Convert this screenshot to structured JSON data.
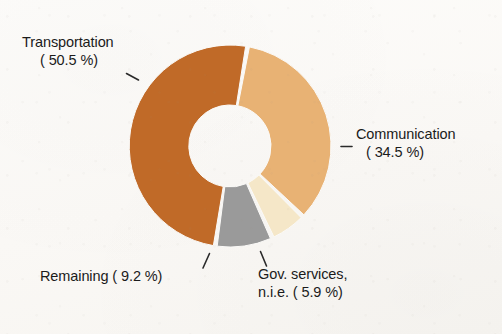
{
  "chart_data": {
    "type": "pie",
    "variant": "donut",
    "title": "",
    "subtitle": "",
    "xlabel": "",
    "ylabel": "",
    "legend_position": "none",
    "labels_position": "outside-with-leader-lines",
    "grid": false,
    "units": "percent",
    "total": 100.1,
    "categories": [
      "Transportation",
      "Communication",
      "Remaining",
      "Gov. services, n.i.e."
    ],
    "values": [
      50.5,
      34.5,
      9.2,
      5.9
    ],
    "slices": [
      {
        "name": "Transportation",
        "value": 50.5,
        "value_text": "50.5 %",
        "label_line1": "Transportation",
        "label_line2": "( 50.5 %)",
        "color": "#c06a28"
      },
      {
        "name": "Communication",
        "value": 34.5,
        "value_text": "34.5 %",
        "label_line1": "Communication",
        "label_line2": "( 34.5 %)",
        "color": "#e8b274"
      },
      {
        "name": "Remaining",
        "value": 9.2,
        "value_text": "9.2 %",
        "label_line1": "Remaining (  9.2 %)",
        "label_line2": "",
        "color": "#9a9a9a"
      },
      {
        "name": "Gov. services, n.i.e.",
        "value": 5.9,
        "value_text": "5.9 %",
        "label_line1": "Gov. services,",
        "label_line2": "n.i.e. (  5.9 %)",
        "color": "#f5e7c8"
      }
    ],
    "geometry": {
      "center_x": 230,
      "center_y": 146,
      "outer_radius": 101,
      "inner_radius": 41,
      "start_angle_deg": 10,
      "direction": "clockwise",
      "gap_deg": 2.2
    },
    "colors": {
      "background": "#fbfaf8",
      "hole": "#fcfbf9",
      "text": "#1b1b1b",
      "leader": "#2a2a2a"
    }
  }
}
